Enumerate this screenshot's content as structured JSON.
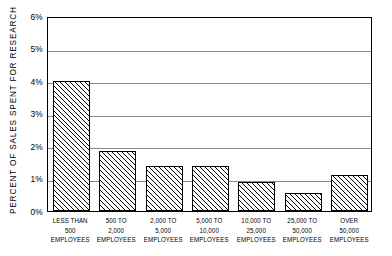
{
  "chart_data": {
    "type": "bar",
    "title": "",
    "xlabel": "",
    "ylabel": "PERCENT OF SALES SPENT FOR RESEARCH",
    "ylim": [
      0,
      6
    ],
    "ytick_labels": [
      "0%",
      "1%",
      "2%",
      "3%",
      "4%",
      "5%",
      "6%"
    ],
    "ytick_values": [
      0,
      1,
      2,
      3,
      4,
      5,
      6
    ],
    "grid": true,
    "legend": "none",
    "categories": [
      "LESS THAN 500 EMPLOYEES",
      "500 TO 2,000 EMPLOYEES",
      "2,000 TO 5,000 EMPLOYEES",
      "5,000 TO 10,000 EMPLOYEES",
      "10,000 TO 25,000 EMPLOYEES",
      "25,000 TO 50,000 EMPLOYEES",
      "OVER 50,000 EMPLOYEES"
    ],
    "category_lines": [
      [
        "LESS THAN",
        "500",
        "EMPLOYEES"
      ],
      [
        "500 TO",
        "2,000",
        "EMPLOYEES"
      ],
      [
        "2,000 TO",
        "5,000",
        "EMPLOYEES"
      ],
      [
        "5,000 TO",
        "10,000",
        "EMPLOYEES"
      ],
      [
        "10,000 TO",
        "25,000",
        "EMPLOYEES"
      ],
      [
        "25,000 TO",
        "50,000",
        "EMPLOYEES"
      ],
      [
        "OVER",
        "50,000",
        "EMPLOYEES"
      ]
    ],
    "values": [
      4.0,
      1.85,
      1.4,
      1.4,
      0.9,
      0.55,
      1.1
    ],
    "bar_fill": "diagonal-hatch",
    "bar_edge_color": "#000000",
    "grid_color": "#8a8a8a",
    "background_color": "#ffffff"
  }
}
